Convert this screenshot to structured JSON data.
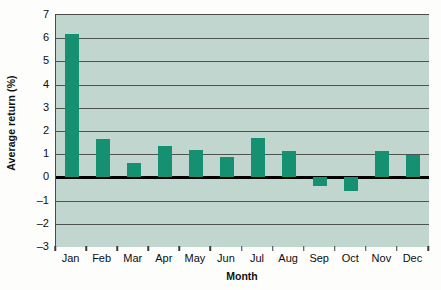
{
  "chart_data": {
    "type": "bar",
    "title": "",
    "xlabel": "Month",
    "ylabel": "Average return (%)",
    "categories": [
      "Jan",
      "Feb",
      "Mar",
      "Apr",
      "May",
      "Jun",
      "Jul",
      "Aug",
      "Sep",
      "Oct",
      "Nov",
      "Dec"
    ],
    "values": [
      6.2,
      1.65,
      0.6,
      1.35,
      1.2,
      0.9,
      1.7,
      1.15,
      -0.35,
      -0.6,
      1.15,
      0.95
    ],
    "ylim": [
      -3,
      7
    ],
    "ytick_labels": [
      "7",
      "6",
      "5",
      "4",
      "3",
      "2",
      "1",
      "0",
      "-1",
      "-2",
      "-3"
    ],
    "ytick_values": [
      7,
      6,
      5,
      4,
      3,
      2,
      1,
      0,
      -1,
      -2,
      -3
    ],
    "grid": true,
    "legend": "none",
    "zero_line": 0,
    "colors": {
      "bar": "#159071",
      "plot_background": "#c0d6cf",
      "gridline": "#3c3c3c",
      "zero_line": "#000000",
      "axis": "#4a4a4a",
      "text": "#0d0d0d",
      "figure_background": "#fdfdfc"
    }
  }
}
